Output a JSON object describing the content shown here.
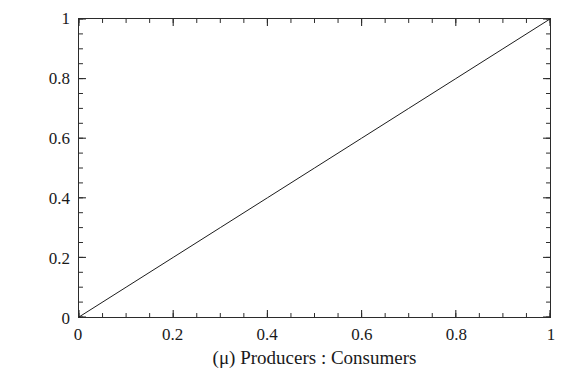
{
  "chart_data": {
    "type": "line",
    "title": "",
    "xlabel": "(μ) Producers : Consumers",
    "ylabel": "(d) Diversity",
    "xlim": [
      0,
      1
    ],
    "ylim": [
      0,
      1
    ],
    "grid": false,
    "legend": null,
    "frame": "box",
    "tick_direction": "in",
    "line_color": "#1a1a1a",
    "background_color": "#ffffff",
    "xticks": [
      0,
      0.2,
      0.4,
      0.6,
      0.8,
      1
    ],
    "xtick_labels": [
      "0",
      "0.2",
      "0.4",
      "0.6",
      "0.8",
      "1"
    ],
    "yticks": [
      0,
      0.2,
      0.4,
      0.6,
      0.8,
      1
    ],
    "ytick_labels": [
      "0",
      "0.2",
      "0.4",
      "0.6",
      "0.8",
      "1"
    ],
    "minor_tick_step": 0.05,
    "series": [
      {
        "name": "diversity",
        "x": [
          0,
          0.1,
          0.2,
          0.3,
          0.4,
          0.5,
          0.6,
          0.7,
          0.8,
          0.9,
          1
        ],
        "values": [
          0,
          0.1,
          0.2,
          0.3,
          0.4,
          0.5,
          0.6,
          0.7,
          0.8,
          0.9,
          1
        ],
        "color": "#1a1a1a",
        "linewidth": 1
      }
    ]
  }
}
